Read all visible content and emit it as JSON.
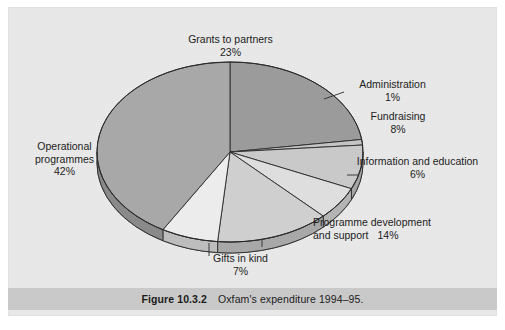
{
  "figure": {
    "caption_number": "Figure 10.3.2",
    "caption_text": "Oxfam's expenditure 1994–95."
  },
  "chart_data": {
    "type": "pie",
    "title": "Oxfam's expenditure 1994–95",
    "units": "percent",
    "legend_position": "labels-around-pie",
    "three_d": true,
    "start_angle_deg": 0,
    "direction": "clockwise",
    "categories": [
      "Grants to partners",
      "Administration",
      "Fundraising",
      "Information and education",
      "Programme development and support",
      "Gifts in kind",
      "Operational programmes"
    ],
    "values": [
      23,
      1,
      8,
      6,
      14,
      7,
      42
    ],
    "slices": [
      {
        "label": "Grants to partners",
        "value": 23,
        "pct_text": "23%",
        "color": "#9b9b9b",
        "side_color": "#7d7d7d"
      },
      {
        "label": "Administration",
        "value": 1,
        "pct_text": "1%",
        "color": "#c4c4c4",
        "side_color": "#a0a0a0"
      },
      {
        "label": "Fundraising",
        "value": 8,
        "pct_text": "8%",
        "color": "#c9c9c9",
        "side_color": "#a4a4a4"
      },
      {
        "label": "Information and education",
        "value": 6,
        "pct_text": "6%",
        "color": "#dedede",
        "side_color": "#b4b4b4"
      },
      {
        "label": "Programme development and support",
        "value": 14,
        "pct_text": "14%",
        "color": "#cfcfcf",
        "side_color": "#a8a8a8"
      },
      {
        "label": "Gifts in kind",
        "value": 7,
        "pct_text": "7%",
        "color": "#ececec",
        "side_color": "#bdbdbd"
      },
      {
        "label": "Operational programmes",
        "value": 42,
        "pct_text": "42%",
        "color": "#a8a8a8",
        "side_color": "#8a8a8a"
      }
    ],
    "total": 101
  },
  "labels": {
    "grants": {
      "name": "Grants to partners",
      "pct": "23%"
    },
    "admin": {
      "name": "Administration",
      "pct": "1%"
    },
    "fund": {
      "name": "Fundraising",
      "pct": "8%"
    },
    "info": {
      "name": "Information and education",
      "pct": "6%"
    },
    "progdev": {
      "name_line1": "Programme development",
      "name_line2": "and support",
      "pct": "14%"
    },
    "gifts": {
      "name": "Gifts in kind",
      "pct": "7%"
    },
    "oper": {
      "name_line1": "Operational",
      "name_line2": "programmes",
      "pct": "42%"
    }
  },
  "colors": {
    "page": "#ffffff",
    "panel": "#e9e9e9",
    "caption_band": "#c9c9c9",
    "outline": "#2a2a2a",
    "text": "#1c1c1c"
  }
}
